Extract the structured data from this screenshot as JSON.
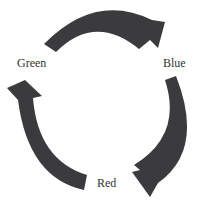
{
  "diagram": {
    "type": "cycle",
    "nodes": [
      {
        "id": "green",
        "label": "Green"
      },
      {
        "id": "blue",
        "label": "Blue"
      },
      {
        "id": "red",
        "label": "Red"
      }
    ],
    "edges": [
      {
        "from": "Green",
        "to": "Blue"
      },
      {
        "from": "Blue",
        "to": "Red"
      },
      {
        "from": "Red",
        "to": "Green"
      }
    ],
    "arrow_color": "#3b3b3e",
    "text_color": "#333333",
    "background": "#ffffff"
  }
}
